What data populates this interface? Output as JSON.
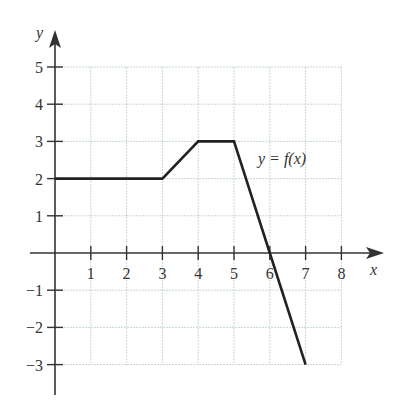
{
  "chart_data": {
    "type": "line",
    "title": "",
    "xlabel": "x",
    "ylabel": "y",
    "series": [
      {
        "name": "y = f(x)",
        "x": [
          0,
          3,
          4,
          5,
          6,
          7
        ],
        "y": [
          2,
          2,
          3,
          3,
          0,
          -3
        ]
      }
    ],
    "xlim": [
      0,
      8
    ],
    "ylim": [
      -3,
      5
    ],
    "x_ticks": [
      1,
      2,
      3,
      4,
      5,
      6,
      7,
      8
    ],
    "y_ticks": [
      -3,
      -2,
      -1,
      1,
      2,
      3,
      4,
      5
    ],
    "grid": true,
    "annotations": [
      {
        "text": "y = f(x)",
        "x": 6.8,
        "y": 2.6
      }
    ],
    "legend": "none"
  },
  "labels": {
    "x_axis": "x",
    "y_axis": "y",
    "curve": "y = f(x)"
  },
  "colors": {
    "axis": "#333333",
    "grid": "#c8d6dc",
    "curve": "#222222"
  }
}
